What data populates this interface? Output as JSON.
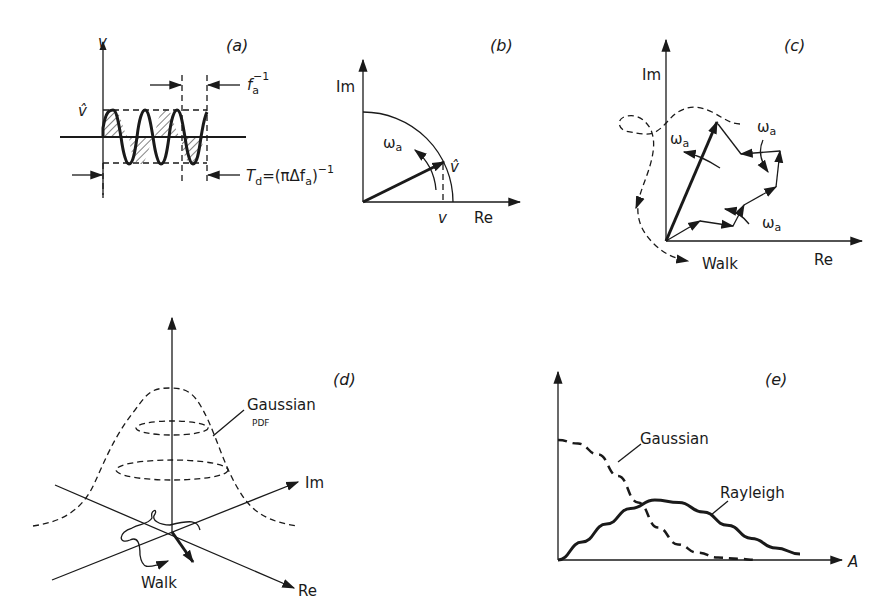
{
  "header": {
    "clipped_title": ""
  },
  "panels": {
    "a": {
      "label": "(a)",
      "axis_label": "v",
      "amplitude_label": "v̂",
      "period_label_base": "f",
      "period_label_sub": "a",
      "period_label_sup": "−1",
      "duration_label": "T",
      "duration_sub": "d",
      "duration_eq": "=(πΔf",
      "duration_eq_sub": "a",
      "duration_eq_close": ")",
      "duration_eq_sup": "−1",
      "cycles": 4
    },
    "b": {
      "label": "(b)",
      "im_label": "Im",
      "re_label": "Re",
      "omega": "ω",
      "omega_sub": "a",
      "vector_label": "v̂",
      "projection_label": "v"
    },
    "c": {
      "label": "(c)",
      "im_label": "Im",
      "re_label": "Re",
      "omega": "ω",
      "omega_sub": "a",
      "walk_label": "Walk"
    },
    "d": {
      "label": "(d)",
      "gaussian_label": "Gaussian",
      "pdf_label": "PDF",
      "im_label": "Im",
      "re_label": "Re",
      "walk_label": "Walk"
    },
    "e": {
      "label": "(e)",
      "x_label": "A",
      "gaussian_label": "Gaussian",
      "rayleigh_label": "Rayleigh"
    }
  },
  "chart_data": {
    "type": "line",
    "title": "(e)",
    "xlabel": "A",
    "ylabel": "",
    "grid": false,
    "x": [
      0,
      0.1,
      0.2,
      0.3,
      0.4,
      0.5,
      0.6,
      0.7,
      0.8,
      0.9,
      1.0
    ],
    "series": [
      {
        "name": "Gaussian",
        "style": "dashed",
        "values": [
          1.0,
          0.97,
          0.88,
          0.7,
          0.48,
          0.27,
          0.13,
          0.06,
          0.02,
          0.01,
          0.0
        ]
      },
      {
        "name": "Rayleigh",
        "style": "solid",
        "values": [
          0.0,
          0.15,
          0.3,
          0.43,
          0.5,
          0.48,
          0.4,
          0.29,
          0.18,
          0.1,
          0.05
        ]
      }
    ]
  }
}
